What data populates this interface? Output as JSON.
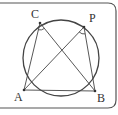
{
  "diagram": {
    "type": "inscribed-angle-circle",
    "points": {
      "C": {
        "label": "C",
        "x": 40,
        "y": 23
      },
      "P": {
        "label": "P",
        "x": 84,
        "y": 27
      },
      "A": {
        "label": "A",
        "x": 24,
        "y": 90
      },
      "B": {
        "label": "B",
        "x": 95,
        "y": 91
      }
    },
    "circle": {
      "cx": 61,
      "cy": 58,
      "r": 38
    },
    "segments": [
      [
        "A",
        "C"
      ],
      [
        "C",
        "B"
      ],
      [
        "A",
        "P"
      ],
      [
        "P",
        "B"
      ],
      [
        "A",
        "B"
      ]
    ],
    "angle_marks": [
      "ACB",
      "APB"
    ],
    "colors": {
      "stroke": "#444444",
      "frame": "#555555",
      "background": "#ffffff"
    }
  }
}
